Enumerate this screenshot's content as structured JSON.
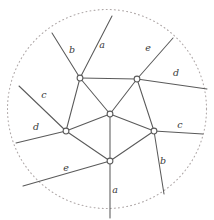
{
  "figure": {
    "colors": {
      "background": "#ffffff",
      "edge": "#5a5a5a",
      "vertex_stroke": "#5a5a5a",
      "vertex_fill": "#ffffff",
      "boundary": "#b0a9a9",
      "label": "#3a3a3a"
    },
    "boundary": {
      "shape": "circle",
      "style": "dotted",
      "cx": 107,
      "cy": 109,
      "r": 99.5
    },
    "vertices": [
      {
        "id": "v-top-left",
        "x": 80,
        "y": 78
      },
      {
        "id": "v-top-right",
        "x": 137,
        "y": 79
      },
      {
        "id": "v-center",
        "x": 110,
        "y": 114
      },
      {
        "id": "v-left",
        "x": 66,
        "y": 131
      },
      {
        "id": "v-right",
        "x": 154,
        "y": 131
      },
      {
        "id": "v-bottom",
        "x": 110,
        "y": 161
      }
    ],
    "inner_edges": [
      {
        "id": "e-tl-tr",
        "from": "v-top-left",
        "to": "v-top-right"
      },
      {
        "id": "e-tl-c",
        "from": "v-top-left",
        "to": "v-center"
      },
      {
        "id": "e-tr-c",
        "from": "v-top-right",
        "to": "v-center"
      },
      {
        "id": "e-tl-l",
        "from": "v-top-left",
        "to": "v-left"
      },
      {
        "id": "e-c-l",
        "from": "v-center",
        "to": "v-left"
      },
      {
        "id": "e-c-r",
        "from": "v-center",
        "to": "v-right"
      },
      {
        "id": "e-tr-r",
        "from": "v-top-right",
        "to": "v-right"
      },
      {
        "id": "e-c-b",
        "from": "v-center",
        "to": "v-bottom"
      },
      {
        "id": "e-l-b",
        "from": "v-left",
        "to": "v-bottom"
      },
      {
        "id": "e-b-r",
        "from": "v-bottom",
        "to": "v-right"
      }
    ],
    "outer_edges": [
      {
        "id": "ray-b-top-left",
        "label": "b",
        "from": "v-top-left",
        "x2": 52,
        "y2": 33,
        "lx": 72,
        "ly": 50
      },
      {
        "id": "ray-a-top",
        "label": "a",
        "from": "v-top-left",
        "x2": 112,
        "y2": 16,
        "lx": 102,
        "ly": 45
      },
      {
        "id": "ray-e-top-right",
        "label": "e",
        "from": "v-top-right",
        "x2": 173,
        "y2": 38,
        "lx": 148,
        "ly": 48
      },
      {
        "id": "ray-d-right-upper",
        "label": "d",
        "from": "v-top-right",
        "x2": 207,
        "y2": 89,
        "lx": 176,
        "ly": 73
      },
      {
        "id": "ray-c-left-upper",
        "label": "c",
        "from": "v-left",
        "x2": 19,
        "y2": 86,
        "lx": 44,
        "ly": 95
      },
      {
        "id": "ray-d-left",
        "label": "d",
        "from": "v-left",
        "x2": 16,
        "y2": 143,
        "lx": 36,
        "ly": 127
      },
      {
        "id": "ray-c-right",
        "label": "c",
        "from": "v-right",
        "x2": 203,
        "y2": 134,
        "lx": 180,
        "ly": 125
      },
      {
        "id": "ray-b-right-lower",
        "label": "b",
        "from": "v-right",
        "x2": 164,
        "y2": 194,
        "lx": 163,
        "ly": 161
      },
      {
        "id": "ray-e-bottom-left",
        "label": "e",
        "from": "v-bottom",
        "x2": 23,
        "y2": 186,
        "lx": 66,
        "ly": 168
      },
      {
        "id": "ray-a-bottom",
        "label": "a",
        "from": "v-bottom",
        "x2": 110,
        "y2": 218,
        "lx": 115,
        "ly": 190
      }
    ]
  }
}
